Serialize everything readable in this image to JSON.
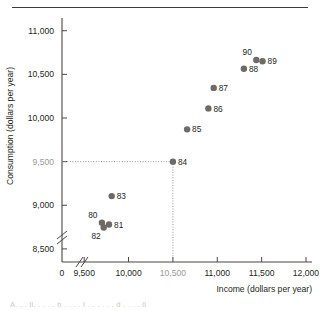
{
  "figure": {
    "top_rule": true,
    "bottom_partial_text": "A.  .  .  ll.  .  .  .  .  h  .  .  .  .  l  .  .  .  .  .  .  d  .  .  .  .  ll"
  },
  "chart_data": {
    "type": "scatter",
    "title": "",
    "xlabel": "Income (dollars per year)",
    "ylabel": "Consumption (dollars per year)",
    "xlim": [
      9250,
      12000
    ],
    "ylim": [
      8350,
      11100
    ],
    "xticks": [
      9500,
      10000,
      10500,
      11000,
      11500,
      12000
    ],
    "xtick_labels": [
      "9,500",
      "10,000",
      "10,500",
      "11,000",
      "11,500",
      "12,000"
    ],
    "yticks": [
      8500,
      9000,
      9500,
      10000,
      10500,
      11000
    ],
    "ytick_labels": [
      "8,500",
      "9,000",
      "9,500",
      "10,000",
      "10,500",
      "11,000"
    ],
    "origin_label": "0",
    "x_axis_break": true,
    "y_axis_break": true,
    "grid": false,
    "legend": "none",
    "highlighted_xtick": "10,500",
    "highlighted_ytick": "9,500",
    "guide_lines": {
      "x": 10500,
      "y": 9500,
      "style": "dotted",
      "meets_point": "84"
    },
    "points": [
      {
        "label": "80",
        "x": 9700,
        "y": 8800,
        "label_pos": "left-up"
      },
      {
        "label": "81",
        "x": 9780,
        "y": 8780,
        "label_pos": "right"
      },
      {
        "label": "82",
        "x": 9720,
        "y": 8745,
        "label_pos": "left-down"
      },
      {
        "label": "83",
        "x": 9810,
        "y": 9105,
        "label_pos": "right"
      },
      {
        "label": "84",
        "x": 10500,
        "y": 9500,
        "label_pos": "right"
      },
      {
        "label": "85",
        "x": 10660,
        "y": 9870,
        "label_pos": "right"
      },
      {
        "label": "86",
        "x": 10900,
        "y": 10110,
        "label_pos": "right"
      },
      {
        "label": "87",
        "x": 10960,
        "y": 10345,
        "label_pos": "right"
      },
      {
        "label": "88",
        "x": 11300,
        "y": 10565,
        "label_pos": "right"
      },
      {
        "label": "89",
        "x": 11510,
        "y": 10650,
        "label_pos": "right"
      },
      {
        "label": "90",
        "x": 11440,
        "y": 10665,
        "label_pos": "left-up"
      }
    ],
    "colors": {
      "dot": "#6d6a68",
      "axis": "#4a4745",
      "guide": "#8d8a88",
      "text": "#231f20",
      "dim_text": "#9a9795"
    }
  }
}
